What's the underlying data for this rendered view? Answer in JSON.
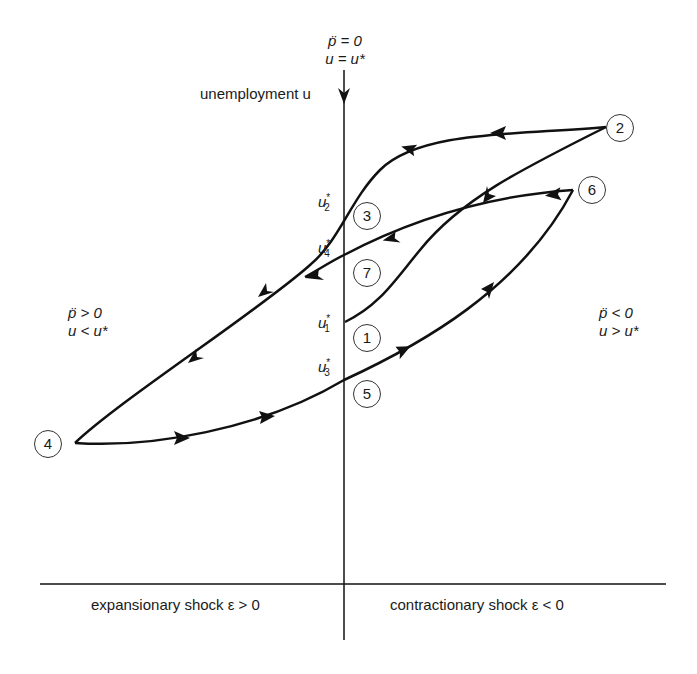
{
  "diagram": {
    "type": "hysteresis-phase-diagram",
    "vertical_axis": {
      "label": "unemployment u",
      "top_condition_line1": "p̈ = 0",
      "top_condition_line2": "u = u*"
    },
    "horizontal_axis": {
      "left_label": "expansionary shock ε > 0",
      "right_label": "contractionary shock ε < 0"
    },
    "regions": {
      "left": {
        "line1": "p̈ > 0",
        "line2": "u < u*"
      },
      "right": {
        "line1": "p̈ < 0",
        "line2": "u > u*"
      }
    },
    "axis_ticks": [
      {
        "id": "u2",
        "base": "u",
        "sup": "*",
        "sub": "2"
      },
      {
        "id": "u4",
        "base": "u",
        "sup": "*",
        "sub": "4"
      },
      {
        "id": "u1",
        "base": "u",
        "sup": "*",
        "sub": "1"
      },
      {
        "id": "u3",
        "base": "u",
        "sup": "*",
        "sub": "3"
      }
    ],
    "nodes": [
      {
        "id": "1",
        "label": "1"
      },
      {
        "id": "2",
        "label": "2"
      },
      {
        "id": "3",
        "label": "3"
      },
      {
        "id": "4",
        "label": "4"
      },
      {
        "id": "5",
        "label": "5"
      },
      {
        "id": "6",
        "label": "6"
      },
      {
        "id": "7",
        "label": "7"
      }
    ],
    "paths": [
      {
        "from": "1",
        "to": "2",
        "direction": "arrow toward 1 (2 → 1)"
      },
      {
        "from": "2",
        "to": "3",
        "direction": "2 → 3 → 4"
      },
      {
        "from": "3",
        "to": "4",
        "direction": "toward 4"
      },
      {
        "from": "4",
        "to": "5",
        "direction": "4 → 5 → 6"
      },
      {
        "from": "6",
        "to": "7",
        "direction": "6 → 7"
      }
    ],
    "line_color": "#111111"
  }
}
